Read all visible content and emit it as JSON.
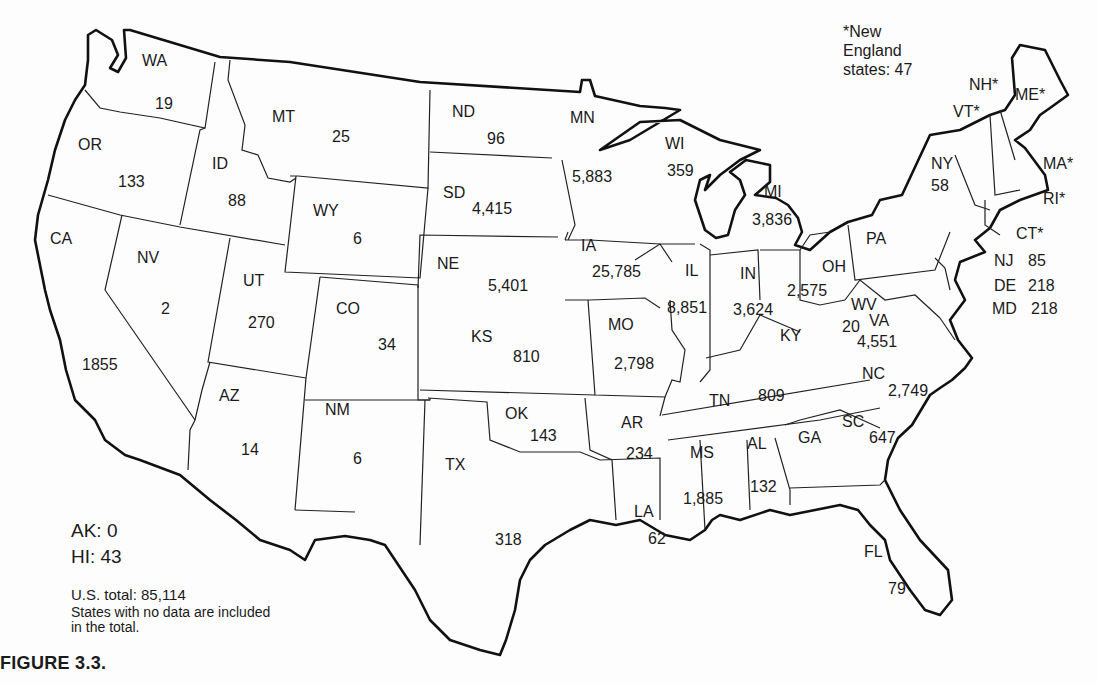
{
  "figure": {
    "caption": "FIGURE 3.3.",
    "new_england_note": [
      "*New",
      "England",
      "states: 47"
    ],
    "ak": "AK: 0",
    "hi": "HI: 43",
    "total": "U.S. total: 85,114",
    "total_note_1": "States with no data are included",
    "total_note_2": "in the total."
  },
  "states": {
    "WA": {
      "label": "WA",
      "value": "19"
    },
    "OR": {
      "label": "OR",
      "value": "133"
    },
    "CA": {
      "label": "CA",
      "value": "1855"
    },
    "ID": {
      "label": "ID",
      "value": "88"
    },
    "NV": {
      "label": "NV",
      "value": "2"
    },
    "MT": {
      "label": "MT",
      "value": "25"
    },
    "WY": {
      "label": "WY",
      "value": "6"
    },
    "UT": {
      "label": "UT",
      "value": "270"
    },
    "CO": {
      "label": "CO",
      "value": "34"
    },
    "AZ": {
      "label": "AZ",
      "value": "14"
    },
    "NM": {
      "label": "NM",
      "value": "6"
    },
    "ND": {
      "label": "ND",
      "value": "96"
    },
    "SD": {
      "label": "SD",
      "value": "4,415"
    },
    "NE": {
      "label": "NE",
      "value": "5,401"
    },
    "KS": {
      "label": "KS",
      "value": "810"
    },
    "OK": {
      "label": "OK",
      "value": "143"
    },
    "TX": {
      "label": "TX",
      "value": "318"
    },
    "MN": {
      "label": "MN",
      "value": "5,883"
    },
    "IA": {
      "label": "IA",
      "value": "25,785"
    },
    "MO": {
      "label": "MO",
      "value": "2,798"
    },
    "AR": {
      "label": "AR",
      "value": "234"
    },
    "LA": {
      "label": "LA",
      "value": "62"
    },
    "WI": {
      "label": "WI",
      "value": "359"
    },
    "IL": {
      "label": "IL",
      "value": "8,851"
    },
    "MI": {
      "label": "MI",
      "value": "3,836"
    },
    "IN": {
      "label": "IN",
      "value": "3,624"
    },
    "OH": {
      "label": "OH",
      "value": "2,575"
    },
    "KY": {
      "label": "KY",
      "value": ""
    },
    "TN": {
      "label": "TN",
      "value": "809"
    },
    "MS": {
      "label": "MS",
      "value": "1,885"
    },
    "AL": {
      "label": "AL",
      "value": "132"
    },
    "GA": {
      "label": "GA",
      "value": ""
    },
    "FL": {
      "label": "FL",
      "value": "79"
    },
    "SC": {
      "label": "SC",
      "value": "647"
    },
    "NC": {
      "label": "NC",
      "value": "2,749"
    },
    "VA": {
      "label": "VA",
      "value": "4,551"
    },
    "WV": {
      "label": "WV",
      "value": "20"
    },
    "PA": {
      "label": "PA",
      "value": ""
    },
    "NY": {
      "label": "NY",
      "value": "58"
    },
    "NJ": {
      "label": "NJ",
      "value": "85"
    },
    "DE": {
      "label": "DE",
      "value": "218"
    },
    "MD": {
      "label": "MD",
      "value": "218"
    },
    "VT": {
      "label": "VT*",
      "value": ""
    },
    "NH": {
      "label": "NH*",
      "value": ""
    },
    "ME": {
      "label": "ME*",
      "value": ""
    },
    "MA": {
      "label": "MA*",
      "value": ""
    },
    "RI": {
      "label": "RI*",
      "value": ""
    },
    "CT": {
      "label": "CT*",
      "value": ""
    }
  }
}
